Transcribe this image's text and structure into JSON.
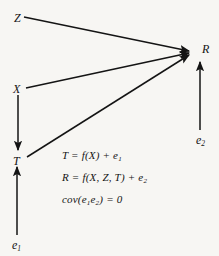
{
  "figure": {
    "type": "path-diagram",
    "background_color": "#f7f6f3",
    "ink_color": "#141414"
  },
  "nodes": [
    {
      "id": "Z",
      "label": "Z",
      "subscript": "",
      "x": 14,
      "y": 12
    },
    {
      "id": "X",
      "label": "X",
      "subscript": "",
      "x": 13,
      "y": 83
    },
    {
      "id": "T",
      "label": "T",
      "subscript": "",
      "x": 13,
      "y": 155
    },
    {
      "id": "R",
      "label": "R",
      "subscript": "",
      "x": 202,
      "y": 43
    },
    {
      "id": "e1",
      "label": "e",
      "subscript": "1",
      "x": 12,
      "y": 239
    },
    {
      "id": "e2",
      "label": "e",
      "subscript": "2",
      "x": 196,
      "y": 134
    }
  ],
  "edges": [
    {
      "id": "z-to-r",
      "from": "Z",
      "to": "R",
      "x1": 24,
      "y1": 17,
      "x2": 189,
      "y2": 51
    },
    {
      "id": "x-to-r",
      "from": "X",
      "to": "R",
      "x1": 26,
      "y1": 88,
      "x2": 189,
      "y2": 53
    },
    {
      "id": "t-to-r",
      "from": "T",
      "to": "R",
      "x1": 27,
      "y1": 157,
      "x2": 189,
      "y2": 55
    },
    {
      "id": "x-to-t",
      "from": "X",
      "to": "T",
      "x1": 18,
      "y1": 95,
      "x2": 18,
      "y2": 150
    },
    {
      "id": "e1-to-t",
      "from": "e1",
      "to": "T",
      "x1": 17,
      "y1": 235,
      "x2": 17,
      "y2": 167
    },
    {
      "id": "e2-to-r",
      "from": "e2",
      "to": "R",
      "x1": 200,
      "y1": 130,
      "x2": 200,
      "y2": 62
    }
  ],
  "equations": [
    {
      "id": "eq-t",
      "text": "T = f(X) + e",
      "subscript": "1",
      "tail": ""
    },
    {
      "id": "eq-r",
      "text": "R = f(X, Z, T) + e",
      "subscript": "2",
      "tail": ""
    },
    {
      "id": "eq-cov",
      "text": "cov(e",
      "subscript": "1",
      "tail": ""
    }
  ],
  "covariance_equation": {
    "prefix": "cov(e",
    "sub1": "1",
    "mid": "e",
    "sub2": "2",
    "suffix": ") = 0"
  }
}
